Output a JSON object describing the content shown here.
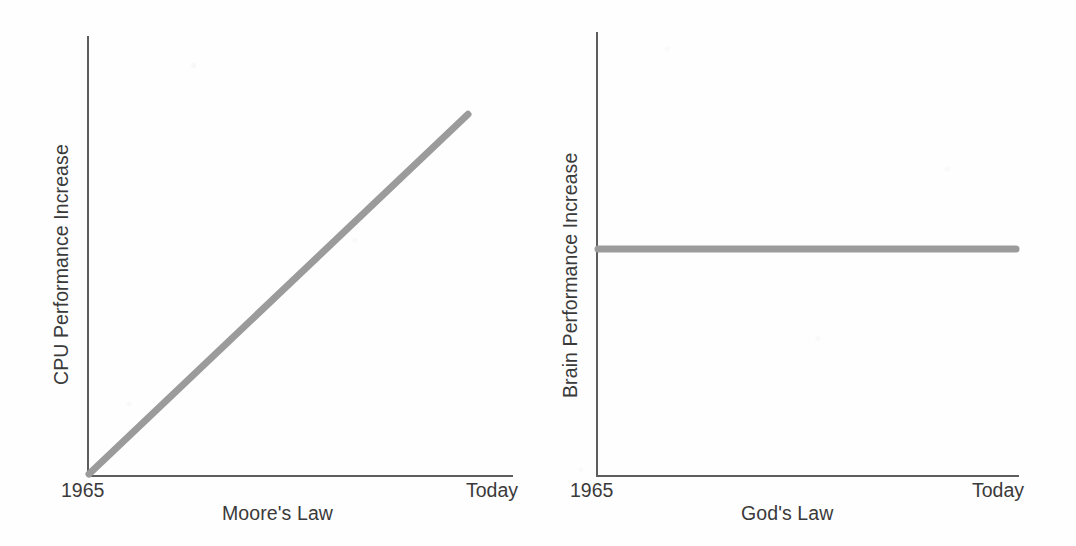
{
  "figure": {
    "background_color": "#fefefe",
    "ink_color": "#3a3a3a",
    "axis_color": "#5d5d5d",
    "series_color": "#9b9b9b"
  },
  "panels": [
    {
      "id": "moores-law",
      "ylabel": "CPU Performance Increase",
      "xlabel": "Moore's Law",
      "xticks": [
        "1965",
        "Today"
      ]
    },
    {
      "id": "gods-law",
      "ylabel": "Brain Performance Increase",
      "xlabel": "God's Law",
      "xticks": [
        "1965",
        "Today"
      ]
    }
  ],
  "chart_data": [
    {
      "type": "line",
      "title": "",
      "xlabel": "Moore's Law",
      "ylabel": "CPU Performance Increase",
      "x": [
        0,
        100
      ],
      "xticklabels": [
        "1965",
        "Today"
      ],
      "xlim": [
        0,
        100
      ],
      "ylim": [
        0,
        100
      ],
      "grid": false,
      "legend": null,
      "series": [
        {
          "name": "CPU Performance Increase",
          "values": [
            0,
            92
          ],
          "color": "#9b9b9b",
          "linewidth": 7,
          "description": "steep steady rise from the origin at 1965 to near the top of the axis Today"
        }
      ]
    },
    {
      "type": "line",
      "title": "",
      "xlabel": "God's Law",
      "ylabel": "Brain Performance Increase",
      "x": [
        0,
        100
      ],
      "xticklabels": [
        "1965",
        "Today"
      ],
      "xlim": [
        0,
        100
      ],
      "ylim": [
        0,
        100
      ],
      "grid": false,
      "legend": null,
      "series": [
        {
          "name": "Brain Performance Increase",
          "values": [
            51,
            51
          ],
          "color": "#9b9b9b",
          "linewidth": 7,
          "description": "perfectly flat line at mid-height from 1965 to Today"
        }
      ]
    }
  ]
}
